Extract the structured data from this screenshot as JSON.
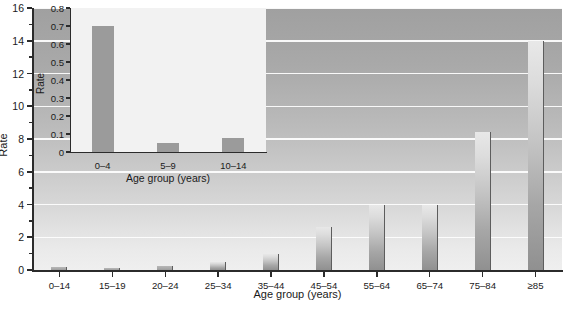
{
  "chart_data": [
    {
      "id": "main",
      "type": "bar",
      "title": "",
      "xlabel": "Age group (years)",
      "ylabel": "Rate",
      "categories": [
        "0–14",
        "15–19",
        "20–24",
        "25–34",
        "35–44",
        "45–54",
        "55–64",
        "65–74",
        "75–84",
        "≥85"
      ],
      "values": [
        0.2,
        0.15,
        0.25,
        0.5,
        1.0,
        2.6,
        4.0,
        4.0,
        8.4,
        14.0
      ],
      "ylim": [
        0,
        16
      ],
      "ytick_labels": [
        "0",
        "2",
        "4",
        "6",
        "8",
        "10",
        "12",
        "14",
        "16"
      ],
      "ytick_values": [
        0,
        2,
        4,
        6,
        8,
        10,
        12,
        14,
        16
      ],
      "yminor_values": [
        1,
        3,
        5,
        7,
        9,
        11,
        13,
        15
      ],
      "grid": "horizontal",
      "legend": "none",
      "plot_background": "gradient-gray-dark-top-to-light-bottom"
    },
    {
      "id": "inset",
      "type": "bar",
      "title": "",
      "xlabel": "Age group (years)",
      "ylabel": "Rate",
      "categories": [
        "0–4",
        "5–9",
        "10–14"
      ],
      "values": [
        0.7,
        0.05,
        0.08
      ],
      "ylim": [
        0,
        0.8
      ],
      "ytick_labels": [
        "0",
        "0.1",
        "0.2",
        "0.3",
        "0.4",
        "0.5",
        "0.6",
        "0.7",
        "0.8"
      ],
      "ytick_values": [
        0,
        0.1,
        0.2,
        0.3,
        0.4,
        0.5,
        0.6,
        0.7,
        0.8
      ],
      "grid": "none",
      "legend": "none",
      "plot_background": "#f2f2f2"
    }
  ],
  "colors": {
    "bar_fill_light": "#e8e8e8",
    "bar_fill_dark": "#909090",
    "bar_edge": "#5d5d5d",
    "inset_bar": "#9b9b9b",
    "axis": "#2b2b2b",
    "gridline": "#fdfdfd",
    "inset_panel": "#f2f2f2",
    "text": "#1a1a1a"
  }
}
